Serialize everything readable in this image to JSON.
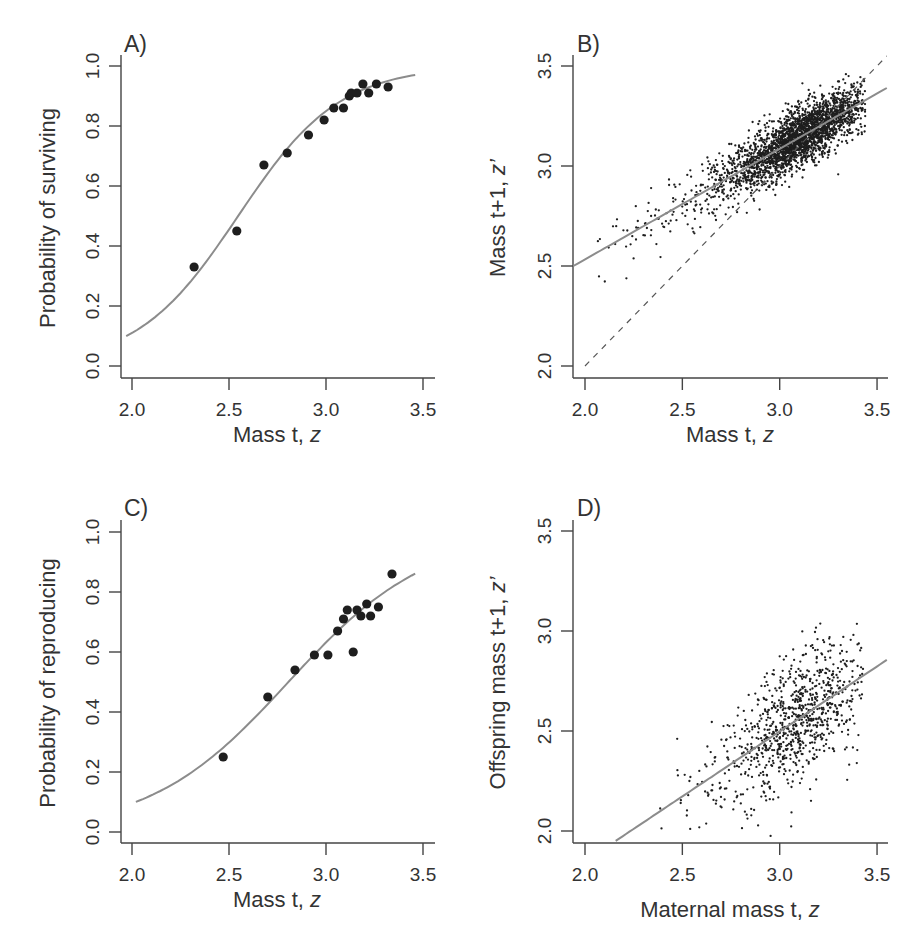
{
  "figure": {
    "panels": [
      {
        "id": "A",
        "letter": "A)",
        "xlabel": "Mass t, ",
        "xlabel_italic": "z",
        "ylabel": "Probability of surviving",
        "xticks": [
          "2.0",
          "2.5",
          "3.0",
          "3.5"
        ],
        "yticks": [
          "0.0",
          "0.2",
          "0.4",
          "0.6",
          "0.8",
          "1.0"
        ]
      },
      {
        "id": "B",
        "letter": "B)",
        "xlabel": "Mass  t, ",
        "xlabel_italic": "z",
        "ylabel": "Mass  t+1, ",
        "ylabel_italic": "z’",
        "xticks": [
          "2.0",
          "2.5",
          "3.0",
          "3.5"
        ],
        "yticks": [
          "2.0",
          "2.5",
          "3.0",
          "3.5"
        ]
      },
      {
        "id": "C",
        "letter": "C)",
        "xlabel": "Mass t, ",
        "xlabel_italic": "z",
        "ylabel": "Probability of reproducing",
        "xticks": [
          "2.0",
          "2.5",
          "3.0",
          "3.5"
        ],
        "yticks": [
          "0.0",
          "0.2",
          "0.4",
          "0.6",
          "0.8",
          "1.0"
        ]
      },
      {
        "id": "D",
        "letter": "D)",
        "xlabel": "Maternal mass t, ",
        "xlabel_italic": "z",
        "ylabel": "Offspring mass t+1, ",
        "ylabel_italic": "z’",
        "xticks": [
          "2.0",
          "2.5",
          "3.0",
          "3.5"
        ],
        "yticks": [
          "2.0",
          "2.5",
          "3.0",
          "3.5"
        ]
      }
    ]
  },
  "chart_data": [
    {
      "panel": "A",
      "type": "scatter",
      "title": "A)",
      "xlabel": "Mass t, z",
      "ylabel": "Probability of surviving",
      "xlim": [
        1.94,
        3.56
      ],
      "ylim": [
        -0.04,
        1.04
      ],
      "xticks": [
        2.0,
        2.5,
        3.0,
        3.5
      ],
      "yticks": [
        0.0,
        0.2,
        0.4,
        0.6,
        0.8,
        1.0
      ],
      "grid": false,
      "points": {
        "x": [
          2.32,
          2.54,
          2.68,
          2.8,
          2.91,
          2.99,
          3.04,
          3.09,
          3.12,
          3.13,
          3.16,
          3.19,
          3.22,
          3.26,
          3.32
        ],
        "y": [
          0.33,
          0.45,
          0.67,
          0.71,
          0.77,
          0.82,
          0.86,
          0.86,
          0.9,
          0.91,
          0.91,
          0.94,
          0.91,
          0.94,
          0.93
        ]
      },
      "fit": {
        "type": "logistic",
        "intercept": -9.73,
        "slope": 3.82,
        "x_range": [
          1.97,
          3.46
        ],
        "color": "#8c8c8c"
      }
    },
    {
      "panel": "B",
      "type": "scatter",
      "title": "B)",
      "xlabel": "Mass  t, z",
      "ylabel": "Mass  t+1, z'",
      "xlim": [
        1.94,
        3.56
      ],
      "ylim": [
        1.94,
        3.56
      ],
      "xticks": [
        2.0,
        2.5,
        3.0,
        3.5
      ],
      "yticks": [
        2.0,
        2.5,
        3.0,
        3.5
      ],
      "grid": false,
      "scatter_summary": {
        "n_points": 2600,
        "x_center": 3.13,
        "x_sd": 0.17,
        "x_min": 2.02,
        "x_max": 3.44,
        "residual_sd": 0.07
      },
      "fit": {
        "type": "linear",
        "intercept": 1.427,
        "slope": 0.553,
        "x_range": [
          1.94,
          3.55
        ],
        "color": "#8c8c8c"
      },
      "reference_line": {
        "type": "dashed",
        "equation": "y = x",
        "x_range": [
          2.0,
          3.55
        ]
      }
    },
    {
      "panel": "C",
      "type": "scatter",
      "title": "C)",
      "xlabel": "Mass t, z",
      "ylabel": "Probability of reproducing",
      "xlim": [
        1.94,
        3.56
      ],
      "ylim": [
        -0.04,
        1.04
      ],
      "xticks": [
        2.0,
        2.5,
        3.0,
        3.5
      ],
      "yticks": [
        0.0,
        0.2,
        0.4,
        0.6,
        0.8,
        1.0
      ],
      "grid": false,
      "points": {
        "x": [
          2.47,
          2.7,
          2.84,
          2.94,
          3.01,
          3.06,
          3.09,
          3.11,
          3.14,
          3.16,
          3.18,
          3.21,
          3.23,
          3.27,
          3.34
        ],
        "y": [
          0.25,
          0.45,
          0.54,
          0.59,
          0.59,
          0.67,
          0.71,
          0.74,
          0.6,
          0.74,
          0.72,
          0.76,
          0.72,
          0.75,
          0.86
        ]
      },
      "fit": {
        "type": "logistic",
        "intercept": -7.83,
        "slope": 2.79,
        "x_range": [
          2.02,
          3.46
        ],
        "color": "#8c8c8c"
      }
    },
    {
      "panel": "D",
      "type": "scatter",
      "title": "D)",
      "xlabel": "Maternal mass t, z",
      "ylabel": "Offspring mass t+1, z'",
      "xlim": [
        1.94,
        3.56
      ],
      "ylim": [
        1.94,
        3.56
      ],
      "xticks": [
        2.0,
        2.5,
        3.0,
        3.5
      ],
      "yticks": [
        2.0,
        2.5,
        3.0,
        3.5
      ],
      "grid": false,
      "scatter_summary": {
        "n_points": 900,
        "x_center": 3.12,
        "x_sd": 0.16,
        "x_min": 2.34,
        "x_max": 3.43,
        "residual_sd": 0.16
      },
      "fit": {
        "type": "linear",
        "intercept": 0.548,
        "slope": 0.65,
        "x_range": [
          2.14,
          3.55
        ],
        "color": "#8c8c8c"
      }
    }
  ]
}
